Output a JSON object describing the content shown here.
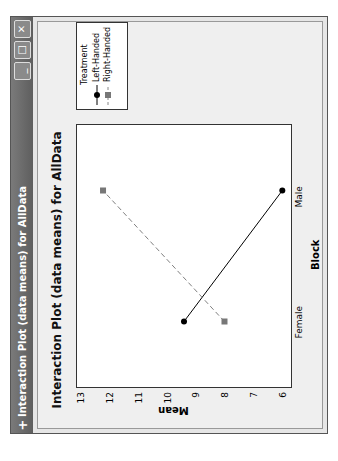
{
  "window": {
    "title": "Interaction Plot (data means) for AllData",
    "buttons": {
      "minimize": "_",
      "maximize": "□",
      "close": "✕"
    }
  },
  "chart_data": {
    "type": "line",
    "title": "Interaction Plot (data means) for AllData",
    "xlabel": "Block",
    "ylabel": "Mean",
    "categories": [
      "Female",
      "Male"
    ],
    "yticks": [
      "6",
      "7",
      "8",
      "9",
      "10",
      "11",
      "12",
      "13"
    ],
    "ylim": [
      5.8,
      13.2
    ],
    "legend": {
      "title": "Treatment",
      "position": "right"
    },
    "series": [
      {
        "name": "Left-Handed",
        "values": [
          9.5,
          6.1
        ],
        "marker": "circle",
        "line": "solid",
        "color": "#000000"
      },
      {
        "name": "Right-Handed",
        "values": [
          8.1,
          12.3
        ],
        "marker": "square",
        "line": "dashed",
        "color": "#808080"
      }
    ],
    "grid": false
  }
}
